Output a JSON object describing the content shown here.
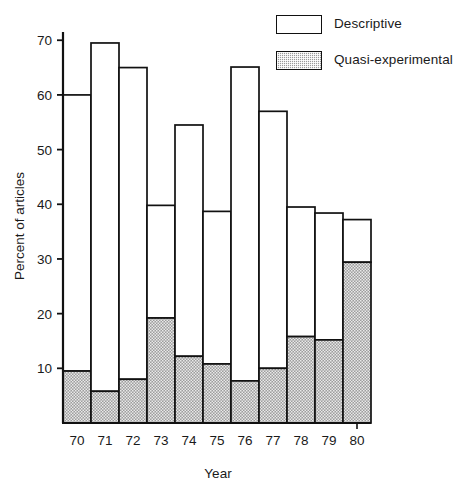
{
  "chart_data": {
    "type": "bar",
    "subtype": "stacked-bar",
    "title": "",
    "xlabel": "Year",
    "ylabel": "Percent of articles",
    "categories": [
      "70",
      "71",
      "72",
      "73",
      "74",
      "75",
      "76",
      "77",
      "78",
      "79",
      "80"
    ],
    "yticks": [
      10,
      20,
      30,
      40,
      50,
      60,
      70
    ],
    "ylim": [
      0,
      73
    ],
    "grid": false,
    "legend_position": "top-right",
    "series": [
      {
        "name": "Quasi-experimental",
        "style": "stippled",
        "color": "#9a9a9a",
        "values": [
          9.5,
          5.8,
          8.0,
          19.2,
          12.2,
          10.8,
          7.7,
          10.0,
          15.8,
          15.2,
          29.4
        ]
      },
      {
        "name": "Descriptive",
        "style": "open",
        "color": "#ffffff",
        "values": [
          50.5,
          63.7,
          57.0,
          20.6,
          42.3,
          27.9,
          57.4,
          47.0,
          23.7,
          23.2,
          7.8
        ]
      }
    ],
    "totals": [
      60.0,
      69.5,
      65.0,
      39.8,
      54.5,
      38.7,
      65.1,
      57.0,
      39.5,
      38.4,
      37.2
    ],
    "annotations": []
  },
  "legend": {
    "items": [
      {
        "label": "Descriptive",
        "swatch": "open-box-icon"
      },
      {
        "label": "Quasi-experimental",
        "swatch": "stippled-box-icon"
      }
    ]
  },
  "axes": {
    "y_title": "Percent of articles",
    "x_title": "Year",
    "y_tick_labels": [
      "10",
      "20",
      "30",
      "40",
      "50",
      "60",
      "70"
    ],
    "x_tick_labels": [
      "70",
      "71",
      "72",
      "73",
      "74",
      "75",
      "76",
      "77",
      "78",
      "79",
      "80"
    ]
  }
}
